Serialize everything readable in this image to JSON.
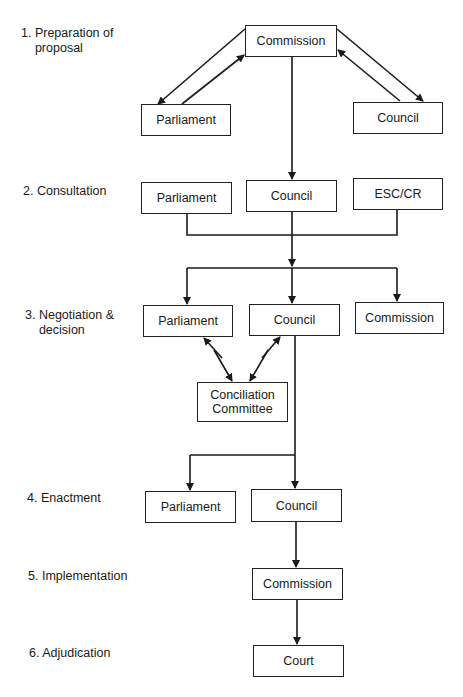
{
  "stages": [
    {
      "number": "1.",
      "label": "Preparation of\nproposal"
    },
    {
      "number": "2.",
      "label": "Consultation"
    },
    {
      "number": "3.",
      "label": "Negotiation &\ndecision"
    },
    {
      "number": "4.",
      "label": "Enactment"
    },
    {
      "number": "5.",
      "label": "Implementation"
    },
    {
      "number": "6.",
      "label": "Adjudication"
    }
  ],
  "nodes": {
    "s1_commission": "Commission",
    "s1_parliament": "Parliament",
    "s1_council": "Council",
    "s2_parliament": "Parliament",
    "s2_council": "Council",
    "s2_esc": "ESC/CR",
    "s3_parliament": "Parliament",
    "s3_council": "Council",
    "s3_commission": "Commission",
    "s3_conciliation": "Conciliation\nCommittee",
    "s4_parliament": "Parliament",
    "s4_council": "Council",
    "s5_commission": "Commission",
    "s6_court": "Court"
  },
  "colors": {
    "line": "#1a1a1a",
    "background": "#ffffff"
  }
}
